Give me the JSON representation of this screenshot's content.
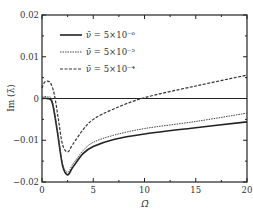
{
  "chart_data": {
    "type": "line",
    "title": "",
    "xlabel": "Ω̄",
    "ylabel": "Im (λ̄)",
    "xlim": [
      0,
      20
    ],
    "ylim": [
      -0.02,
      0.02
    ],
    "xticks": [
      "0",
      "5",
      "10",
      "15",
      "20"
    ],
    "yticks": [
      "0.02",
      "0.01",
      "0",
      "-0.01",
      "-0.02"
    ],
    "grid": false,
    "legend_position": "upper right",
    "series": [
      {
        "name": "ν̄ = 5×10⁻⁶",
        "style": "solid",
        "x": [
          0,
          0.5,
          1,
          1.5,
          2,
          2.5,
          3,
          4,
          5,
          7,
          10,
          15,
          20
        ],
        "y": [
          0.0,
          0.0,
          -0.001,
          -0.008,
          -0.016,
          -0.0183,
          -0.0165,
          -0.0132,
          -0.0115,
          -0.0098,
          -0.0085,
          -0.007,
          -0.0056
        ]
      },
      {
        "name": "ν̄ = 5×10⁻⁵",
        "style": "dotted",
        "x": [
          0,
          0.5,
          1,
          1.5,
          2,
          2.5,
          3,
          4,
          5,
          7,
          10,
          15,
          20
        ],
        "y": [
          0.0005,
          0.0004,
          -0.0005,
          -0.0075,
          -0.0155,
          -0.0177,
          -0.0158,
          -0.0125,
          -0.0105,
          -0.0088,
          -0.0072,
          -0.0055,
          -0.0035
        ]
      },
      {
        "name": "ν̄ = 5×10⁻⁴",
        "style": "dashed",
        "x": [
          0,
          0.3,
          0.8,
          1.2,
          1.6,
          2,
          2.5,
          3,
          4,
          5,
          7,
          10,
          15,
          20
        ],
        "y": [
          0.0025,
          0.004,
          0.0038,
          0.001,
          -0.005,
          -0.011,
          -0.0128,
          -0.011,
          -0.0075,
          -0.005,
          -0.0025,
          0.0002,
          0.003,
          0.0056
        ]
      }
    ]
  },
  "labels": {
    "xlabel": "Ω̄",
    "ylabel": "Im (λ̄)",
    "legend": [
      "ν̄ = 5×10⁻⁶",
      "ν̄ = 5×10⁻⁵",
      "ν̄ = 5×10⁻⁴"
    ],
    "xticks": [
      "0",
      "5",
      "10",
      "15",
      "20"
    ],
    "yticks": [
      "0.02",
      "0.01",
      "0",
      "−0.01",
      "−0.02"
    ]
  }
}
